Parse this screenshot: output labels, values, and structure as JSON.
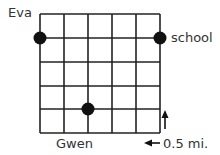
{
  "diagram": {
    "type": "grid-map",
    "grid": {
      "columns": 5,
      "rows": 5
    },
    "points": [
      {
        "label": "Eva",
        "grid_x": 0,
        "grid_y": 1
      },
      {
        "label": "school",
        "grid_x": 5,
        "grid_y": 1
      },
      {
        "label": "Gwen",
        "grid_x": 2,
        "grid_y": 4
      }
    ],
    "scale": {
      "label": "0.5 mi.",
      "note": "each grid square side = 0.5 mi."
    }
  },
  "labels": {
    "eva": "Eva",
    "school": "school",
    "gwen": "Gwen",
    "scale": "0.5 mi."
  }
}
